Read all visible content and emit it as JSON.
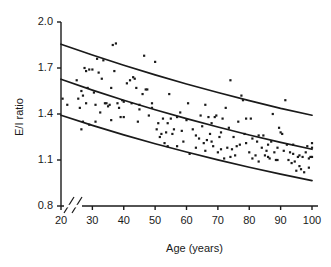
{
  "chart_data": {
    "type": "scatter",
    "title": "",
    "xlabel": "Age (years)",
    "ylabel": "E/I ratio",
    "xlim": [
      20,
      100
    ],
    "ylim": [
      0.8,
      2.0
    ],
    "grid": false,
    "legend": null,
    "x_axis_break": true,
    "x_ticks": [
      20,
      30,
      40,
      50,
      60,
      70,
      80,
      90,
      100
    ],
    "x_tick_labels": [
      "20",
      "30",
      "40",
      "50",
      "60",
      "70",
      "80",
      "90",
      "100"
    ],
    "y_ticks": [
      0.8,
      1.1,
      1.4,
      1.7,
      2.0
    ],
    "y_tick_labels": [
      "0.8",
      "1.1",
      "1.4",
      "1.7",
      "2.0"
    ],
    "marker": "square",
    "marker_color": "#1a1a1a",
    "marker_size": 2.2,
    "line_color": "#1a1a1a",
    "line_width": 1.7,
    "points": [
      [
        20.5,
        1.5
      ],
      [
        22.0,
        1.46
      ],
      [
        25.0,
        1.62
      ],
      [
        25.5,
        1.5
      ],
      [
        26.0,
        1.44
      ],
      [
        26.5,
        1.3
      ],
      [
        27.0,
        1.52
      ],
      [
        27.0,
        1.35
      ],
      [
        27.5,
        1.7
      ],
      [
        28.0,
        1.68
      ],
      [
        28.5,
        1.57
      ],
      [
        29.0,
        1.69
      ],
      [
        30.0,
        1.69
      ],
      [
        30.5,
        1.54
      ],
      [
        31.0,
        1.46
      ],
      [
        31.5,
        1.76
      ],
      [
        32.0,
        1.67
      ],
      [
        32.5,
        1.41
      ],
      [
        33.0,
        1.63
      ],
      [
        33.5,
        1.75
      ],
      [
        34.0,
        1.47
      ],
      [
        34.5,
        1.47
      ],
      [
        35.0,
        1.45
      ],
      [
        35.5,
        1.46
      ],
      [
        36.0,
        1.57
      ],
      [
        36.5,
        1.85
      ],
      [
        37.0,
        1.68
      ],
      [
        37.5,
        1.86
      ],
      [
        38.0,
        1.47
      ],
      [
        38.5,
        1.44
      ],
      [
        39.0,
        1.38
      ],
      [
        39.5,
        1.49
      ],
      [
        40.0,
        1.48
      ],
      [
        41.0,
        1.6
      ],
      [
        42.0,
        1.62
      ],
      [
        42.5,
        1.47
      ],
      [
        43.0,
        1.64
      ],
      [
        43.5,
        1.63
      ],
      [
        44.0,
        1.57
      ],
      [
        44.5,
        1.35
      ],
      [
        45.0,
        1.43
      ],
      [
        46.0,
        1.53
      ],
      [
        46.5,
        1.78
      ],
      [
        47.0,
        1.56
      ],
      [
        47.5,
        1.56
      ],
      [
        48.0,
        1.39
      ],
      [
        49.0,
        1.47
      ],
      [
        50.0,
        1.74
      ],
      [
        50.5,
        1.3
      ],
      [
        51.0,
        1.34
      ],
      [
        51.5,
        1.25
      ],
      [
        52.0,
        1.27
      ],
      [
        52.5,
        1.37
      ],
      [
        53.0,
        1.21
      ],
      [
        53.5,
        1.28
      ],
      [
        54.0,
        1.34
      ],
      [
        54.5,
        1.53
      ],
      [
        55.0,
        1.37
      ],
      [
        55.5,
        1.27
      ],
      [
        56.0,
        1.3
      ],
      [
        57.0,
        1.38
      ],
      [
        58.0,
        1.41
      ],
      [
        58.5,
        1.29
      ],
      [
        59.0,
        1.22
      ],
      [
        60.0,
        1.36
      ],
      [
        60.5,
        1.47
      ],
      [
        61.0,
        1.14
      ],
      [
        62.0,
        1.3
      ],
      [
        63.0,
        1.26
      ],
      [
        64.0,
        1.24
      ],
      [
        64.5,
        1.39
      ],
      [
        65.0,
        1.32
      ],
      [
        65.5,
        1.21
      ],
      [
        66.0,
        1.46
      ],
      [
        66.5,
        1.23
      ],
      [
        67.0,
        1.38
      ],
      [
        67.5,
        1.27
      ],
      [
        68.0,
        1.22
      ],
      [
        68.5,
        1.19
      ],
      [
        69.0,
        1.38
      ],
      [
        69.5,
        1.39
      ],
      [
        70.0,
        1.15
      ],
      [
        70.5,
        1.25
      ],
      [
        71.0,
        1.17
      ],
      [
        71.5,
        1.37
      ],
      [
        72.0,
        1.11
      ],
      [
        72.5,
        1.44
      ],
      [
        73.0,
        1.18
      ],
      [
        73.5,
        1.31
      ],
      [
        74.0,
        1.62
      ],
      [
        74.5,
        1.17
      ],
      [
        75.0,
        1.25
      ],
      [
        75.5,
        1.13
      ],
      [
        76.0,
        1.19
      ],
      [
        76.5,
        1.35
      ],
      [
        77.0,
        1.2
      ],
      [
        77.5,
        1.52
      ],
      [
        78.0,
        1.49
      ],
      [
        78.5,
        1.27
      ],
      [
        79.0,
        1.21
      ],
      [
        80.0,
        1.15
      ],
      [
        80.5,
        1.37
      ],
      [
        81.0,
        1.24
      ],
      [
        82.0,
        1.13
      ],
      [
        82.5,
        1.22
      ],
      [
        83.0,
        1.09
      ],
      [
        84.0,
        1.18
      ],
      [
        84.5,
        1.26
      ],
      [
        85.0,
        1.13
      ],
      [
        85.5,
        1.16
      ],
      [
        86.0,
        1.12
      ],
      [
        86.5,
        1.11
      ],
      [
        87.0,
        1.22
      ],
      [
        87.5,
        1.4
      ],
      [
        88.0,
        1.15
      ],
      [
        88.5,
        1.1
      ],
      [
        89.0,
        1.1
      ],
      [
        89.5,
        1.31
      ],
      [
        90.0,
        1.28
      ],
      [
        90.5,
        1.27
      ],
      [
        91.0,
        1.16
      ],
      [
        91.5,
        1.49
      ],
      [
        92.0,
        1.2
      ],
      [
        92.5,
        1.1
      ],
      [
        93.0,
        1.15
      ],
      [
        93.5,
        1.08
      ],
      [
        94.0,
        1.14
      ],
      [
        94.5,
        1.09
      ],
      [
        95.0,
        1.03
      ],
      [
        95.5,
        1.12
      ],
      [
        96.0,
        1.06
      ],
      [
        96.5,
        1.04
      ],
      [
        97.0,
        1.12
      ],
      [
        97.5,
        1.02
      ],
      [
        98.0,
        1.15
      ],
      [
        98.5,
        1.19
      ],
      [
        99.0,
        1.11
      ],
      [
        99.5,
        1.12
      ],
      [
        100.0,
        1.21
      ],
      [
        100.0,
        1.18
      ],
      [
        100.0,
        1.12
      ],
      [
        99.0,
        1.05
      ],
      [
        96.0,
        1.13
      ],
      [
        94.0,
        1.2
      ],
      [
        89.0,
        1.18
      ],
      [
        86.0,
        1.2
      ],
      [
        83.0,
        1.26
      ],
      [
        81.0,
        1.11
      ],
      [
        79.0,
        1.37
      ],
      [
        74.0,
        1.12
      ],
      [
        71.0,
        1.28
      ],
      [
        68.0,
        1.34
      ],
      [
        66.0,
        1.16
      ],
      [
        63.0,
        1.18
      ],
      [
        57.0,
        1.19
      ],
      [
        54.0,
        1.19
      ],
      [
        49.0,
        1.44
      ],
      [
        45.0,
        1.46
      ],
      [
        40.0,
        1.38
      ],
      [
        36.0,
        1.36
      ],
      [
        31.0,
        1.35
      ],
      [
        29.0,
        1.33
      ],
      [
        26.5,
        1.55
      ],
      [
        28.0,
        1.47
      ]
    ],
    "reference_curves": [
      {
        "name": "upper",
        "x": [
          20,
          30,
          40,
          50,
          60,
          70,
          80,
          90,
          100
        ],
        "y": [
          1.855,
          1.785,
          1.718,
          1.655,
          1.596,
          1.54,
          1.487,
          1.437,
          1.392
        ]
      },
      {
        "name": "median",
        "x": [
          20,
          30,
          40,
          50,
          60,
          70,
          80,
          90,
          100
        ],
        "y": [
          1.627,
          1.556,
          1.49,
          1.428,
          1.37,
          1.315,
          1.263,
          1.215,
          1.17
        ]
      },
      {
        "name": "lower",
        "x": [
          20,
          30,
          40,
          50,
          60,
          70,
          80,
          90,
          100
        ],
        "y": [
          1.392,
          1.326,
          1.264,
          1.206,
          1.152,
          1.101,
          1.053,
          1.008,
          0.966
        ]
      }
    ]
  },
  "axes": {
    "y_title": "E/I ratio",
    "x_title": "Age (years)",
    "y_labels": [
      "2.0",
      "1.7",
      "1.4",
      "1.1",
      "0.8"
    ],
    "x_labels": [
      "20",
      "30",
      "40",
      "50",
      "60",
      "70",
      "80",
      "90",
      "100"
    ]
  },
  "colors": {
    "ink": "#1a1a1a",
    "background": "#ffffff"
  }
}
